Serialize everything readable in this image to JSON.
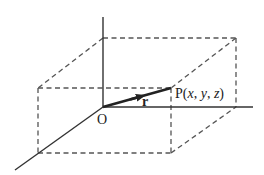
{
  "diagram": {
    "title": "",
    "colors": {
      "stroke": "#333333",
      "dash": "#555555",
      "text": "#222222",
      "background": "#ffffff"
    },
    "labels": {
      "origin": "O",
      "vector": "r",
      "point_prefix": "P(",
      "point_x": "x",
      "sep1": ", ",
      "point_y": "y",
      "sep2": ", ",
      "point_z": "z",
      "point_suffix": ")"
    },
    "geometry": {
      "origin": [
        103,
        107
      ],
      "point_P": [
        171,
        88
      ],
      "axes": {
        "z_axis": {
          "from": [
            103,
            107
          ],
          "to": [
            103,
            17
          ]
        },
        "y_axis": {
          "from": [
            103,
            107
          ],
          "to": [
            253,
            107
          ]
        },
        "x_axis": {
          "from": [
            103,
            107
          ],
          "to": [
            15,
            170
          ]
        }
      },
      "box_vertices": {
        "origin": [
          103,
          107
        ],
        "z_top": [
          103,
          38
        ],
        "back_top_right": [
          236,
          38
        ],
        "back_bottom_right": [
          236,
          107
        ],
        "front_top_left": [
          38,
          88
        ],
        "front_top_right_P": [
          171,
          88
        ],
        "front_bottom_left": [
          38,
          153
        ],
        "front_bottom_right": [
          171,
          153
        ]
      }
    }
  }
}
